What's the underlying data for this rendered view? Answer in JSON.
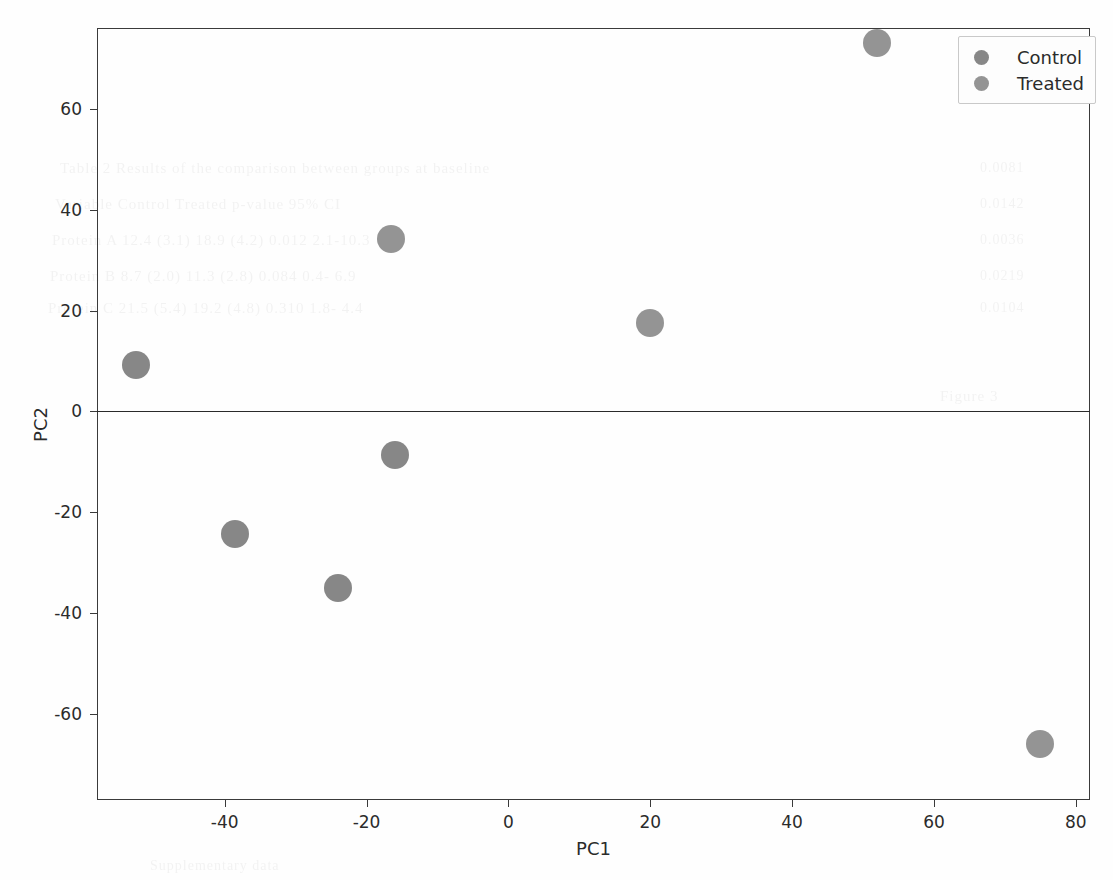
{
  "figure": {
    "background_color": "#fefefe",
    "frame_color": "#3a3a3a"
  },
  "chart_data": {
    "type": "scatter",
    "title": "",
    "xlabel": "PC1",
    "ylabel": "PC2",
    "xlim": [
      -58,
      82
    ],
    "ylim": [
      -77,
      76
    ],
    "grid": false,
    "legend_position": "upper right",
    "marker_color": "#808080",
    "marker_size_px": 28,
    "zero_line": {
      "axis": "y",
      "value": 0,
      "color": "#2a2a2a"
    },
    "xticks": [
      -40,
      -20,
      0,
      20,
      40,
      60,
      80
    ],
    "xtick_labels": [
      "-40",
      "-20",
      "0",
      "20",
      "40",
      "60",
      "80"
    ],
    "yticks": [
      -60,
      -40,
      -20,
      0,
      20,
      40,
      60
    ],
    "ytick_labels": [
      "-60",
      "-40",
      "-20",
      "0",
      "20",
      "40",
      "60"
    ],
    "series": [
      {
        "name": "Control",
        "color": "#7d7d7d",
        "points": [
          {
            "x": -52.5,
            "y": 9.2
          },
          {
            "x": -38.5,
            "y": -24.2
          },
          {
            "x": -24.0,
            "y": -35.0
          },
          {
            "x": -16.0,
            "y": -8.7
          }
        ]
      },
      {
        "name": "Treated",
        "color": "#8b8b8b",
        "points": [
          {
            "x": -16.5,
            "y": 34.2
          },
          {
            "x": 20.0,
            "y": 17.6
          },
          {
            "x": 52.0,
            "y": 73.0
          },
          {
            "x": 75.0,
            "y": -66.0
          }
        ]
      }
    ]
  },
  "legend": {
    "entries": [
      {
        "label": "Control",
        "color": "#7d7d7d"
      },
      {
        "label": "Treated",
        "color": "#8b8b8b"
      }
    ]
  },
  "ghost_text": {
    "lines": [
      {
        "text": "Table 2  Results of the comparison between groups at baseline",
        "x": 60,
        "y": 160,
        "size": 15
      },
      {
        "text": "Variable      Control      Treated      p-value      95% CI",
        "x": 55,
        "y": 196,
        "size": 15
      },
      {
        "text": "Protein A     12.4 (3.1)   18.9 (4.2)   0.012        2.1-10.3",
        "x": 52,
        "y": 232,
        "size": 15
      },
      {
        "text": "Protein B      8.7 (2.0)   11.3 (2.8)   0.084        0.4- 6.9",
        "x": 50,
        "y": 268,
        "size": 15
      },
      {
        "text": "Protein C     21.5 (5.4)   19.2 (4.8)   0.310        1.8- 4.4",
        "x": 48,
        "y": 300,
        "size": 15
      },
      {
        "text": "Figure 3",
        "x": 940,
        "y": 388,
        "size": 15
      },
      {
        "text": "0.0081",
        "x": 980,
        "y": 160,
        "size": 14
      },
      {
        "text": "0.0142",
        "x": 980,
        "y": 196,
        "size": 14
      },
      {
        "text": "0.0036",
        "x": 980,
        "y": 232,
        "size": 14
      },
      {
        "text": "0.0219",
        "x": 980,
        "y": 268,
        "size": 14
      },
      {
        "text": "0.0104",
        "x": 980,
        "y": 300,
        "size": 14
      },
      {
        "text": "Supplementary data",
        "x": 150,
        "y": 858,
        "size": 14
      }
    ]
  }
}
